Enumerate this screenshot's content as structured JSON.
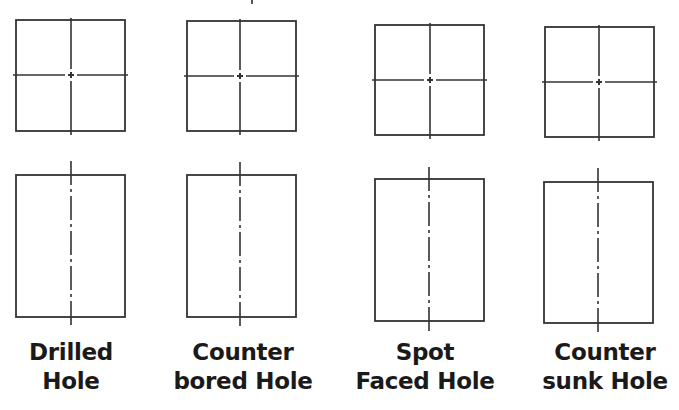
{
  "figure": {
    "stroke_color": "#333333",
    "background": "#ffffff",
    "columns": [
      {
        "id": "drilled",
        "label_lines": [
          "Drilled",
          "Hole"
        ],
        "label_center_x": 71,
        "top_view": {
          "x": 16,
          "y": 20,
          "w": 109,
          "h": 111,
          "cx": 71,
          "cy": 75
        },
        "front_view": {
          "x": 16,
          "y": 175,
          "w": 109,
          "h": 142,
          "cx": 71,
          "line_y1": 161,
          "line_y2": 329
        }
      },
      {
        "id": "counterbored",
        "label_lines": [
          "Counter",
          "bored Hole"
        ],
        "label_center_x": 243,
        "top_view": {
          "x": 187,
          "y": 21,
          "w": 109,
          "h": 110,
          "cx": 240,
          "cy": 76
        },
        "front_view": {
          "x": 187,
          "y": 175,
          "w": 109,
          "h": 142,
          "cx": 240,
          "line_y1": 162,
          "line_y2": 329
        }
      },
      {
        "id": "spotfaced",
        "label_lines": [
          "Spot",
          "Faced Hole"
        ],
        "label_center_x": 425,
        "top_view": {
          "x": 375,
          "y": 25,
          "w": 109,
          "h": 110,
          "cx": 430,
          "cy": 80
        },
        "front_view": {
          "x": 375,
          "y": 179,
          "w": 109,
          "h": 142,
          "cx": 429,
          "line_y1": 167,
          "line_y2": 333
        }
      },
      {
        "id": "countersunk",
        "label_lines": [
          "Counter",
          "sunk Hole"
        ],
        "label_center_x": 605,
        "top_view": {
          "x": 545,
          "y": 27,
          "w": 109,
          "h": 110,
          "cx": 599,
          "cy": 82
        },
        "front_view": {
          "x": 544,
          "y": 182,
          "w": 109,
          "h": 141,
          "cx": 598,
          "line_y1": 168,
          "line_y2": 335
        }
      }
    ]
  }
}
